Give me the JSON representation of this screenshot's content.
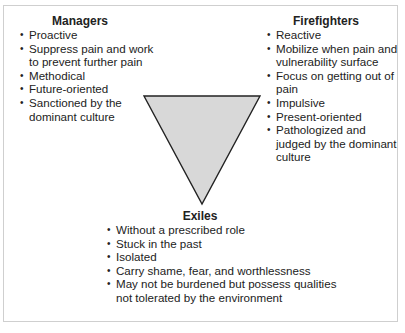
{
  "diagram": {
    "shape_fill": "#d8d8d8",
    "shape_stroke": "#222222",
    "border_color": "#cfcfcf"
  },
  "managers": {
    "title": "Managers",
    "items": [
      "Proactive",
      "Suppress pain and work to prevent further pain",
      "Methodical",
      "Future-oriented",
      "Sanctioned by the dominant culture"
    ]
  },
  "firefighters": {
    "title": "Firefighters",
    "items": [
      "Reactive",
      "Mobilize when pain and vulnerability surface",
      "Focus on getting out of pain",
      "Impulsive",
      "Present-oriented",
      "Pathologized and judged by the dominant culture"
    ]
  },
  "exiles": {
    "title": "Exiles",
    "items": [
      "Without a prescribed role",
      "Stuck in the past",
      "Isolated",
      "Carry shame, fear, and worthlessness",
      "May not be burdened but possess qualities not tolerated by the environment"
    ]
  }
}
